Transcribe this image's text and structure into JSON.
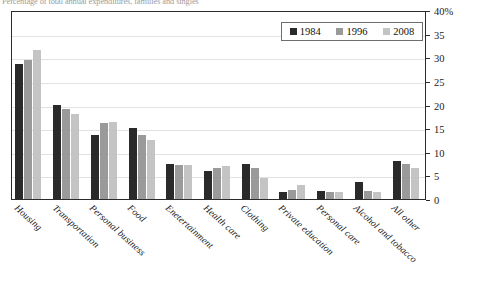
{
  "chart_data": {
    "type": "bar",
    "title": "Percentage of total annual expenditures, families and singles",
    "xlabel": "",
    "ylabel": "",
    "ylim": [
      0,
      40
    ],
    "ytick_labels": [
      "0",
      "5",
      "10",
      "15",
      "20",
      "25",
      "30",
      "35",
      "40%"
    ],
    "ytick_values": [
      0,
      5,
      10,
      15,
      20,
      25,
      30,
      35,
      40
    ],
    "grid": true,
    "legend_position": "top-right",
    "categories": [
      "Housing",
      "Transportation",
      "Personal business",
      "Food",
      "Enetertainment",
      "Health care",
      "Clothing",
      "Private education",
      "Personal care",
      "Alcohol and tobacco",
      "All other"
    ],
    "series": [
      {
        "name": "1984",
        "color": "#2a2a2a",
        "values": [
          28.5,
          20.0,
          13.5,
          15.0,
          7.5,
          6.0,
          7.5,
          1.5,
          1.8,
          3.5,
          8.0
        ]
      },
      {
        "name": "1996",
        "color": "#9a9a9a",
        "values": [
          29.5,
          19.0,
          16.0,
          13.5,
          7.2,
          6.5,
          6.5,
          2.0,
          1.5,
          1.8,
          7.5
        ]
      },
      {
        "name": "2008",
        "color": "#c4c4c4",
        "values": [
          31.5,
          18.0,
          16.2,
          12.5,
          7.2,
          7.0,
          4.5,
          3.0,
          1.5,
          1.5,
          6.5
        ]
      }
    ]
  }
}
